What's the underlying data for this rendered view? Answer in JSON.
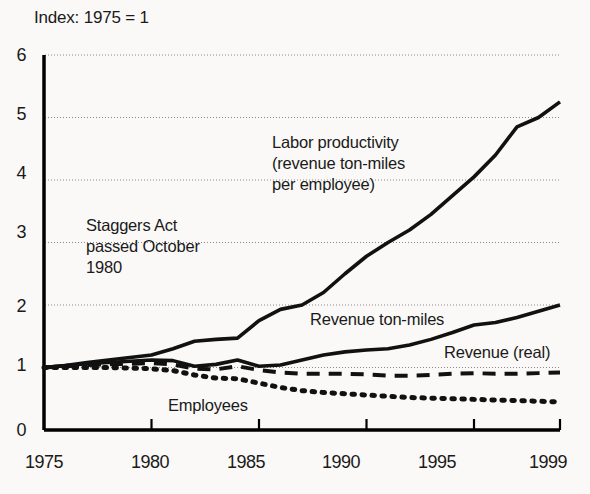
{
  "chart_data": {
    "type": "line",
    "title": "Index: 1975 = 1",
    "xlabel": "",
    "ylabel": "",
    "xlim": [
      1975,
      1999
    ],
    "ylim": [
      0,
      6
    ],
    "xticks": [
      "1975",
      "1980",
      "1985",
      "1990",
      "1995",
      "1999"
    ],
    "xtick_values": [
      1975,
      1980,
      1985,
      1990,
      1995,
      1999
    ],
    "yticks": [
      "0",
      "1",
      "2",
      "3",
      "4",
      "5",
      "6"
    ],
    "ytick_values": [
      0,
      1,
      2,
      3,
      4,
      5,
      6
    ],
    "grid": "horizontal dotted gridlines at each integer y value from 1 to 6",
    "legend": "inline labels placed next to each series",
    "x": [
      1975,
      1976,
      1977,
      1978,
      1979,
      1980,
      1981,
      1982,
      1983,
      1984,
      1985,
      1986,
      1987,
      1988,
      1989,
      1990,
      1991,
      1992,
      1993,
      1994,
      1995,
      1996,
      1997,
      1998,
      1999
    ],
    "series": [
      {
        "name": "Labor productivity (revenue ton-miles per employee)",
        "style": "solid",
        "values": [
          1.0,
          1.03,
          1.08,
          1.12,
          1.16,
          1.2,
          1.3,
          1.42,
          1.45,
          1.47,
          1.75,
          1.93,
          2.0,
          2.2,
          2.5,
          2.78,
          3.0,
          3.2,
          3.45,
          3.75,
          4.05,
          4.4,
          4.85,
          5.0,
          5.25
        ]
      },
      {
        "name": "Revenue ton-miles",
        "style": "solid",
        "values": [
          1.0,
          1.03,
          1.06,
          1.08,
          1.1,
          1.12,
          1.11,
          1.02,
          1.05,
          1.12,
          1.02,
          1.04,
          1.12,
          1.2,
          1.25,
          1.28,
          1.3,
          1.36,
          1.45,
          1.56,
          1.68,
          1.72,
          1.8,
          1.9,
          2.0
        ]
      },
      {
        "name": "Revenue (real)",
        "style": "dashed",
        "values": [
          1.0,
          1.02,
          1.04,
          1.05,
          1.06,
          1.07,
          1.05,
          0.98,
          0.97,
          1.02,
          0.96,
          0.92,
          0.9,
          0.9,
          0.9,
          0.89,
          0.87,
          0.87,
          0.88,
          0.9,
          0.91,
          0.9,
          0.9,
          0.91,
          0.92
        ]
      },
      {
        "name": "Employees",
        "style": "dotted",
        "values": [
          1.0,
          1.0,
          1.0,
          1.0,
          0.99,
          0.98,
          0.95,
          0.88,
          0.83,
          0.82,
          0.75,
          0.68,
          0.63,
          0.6,
          0.58,
          0.56,
          0.54,
          0.52,
          0.51,
          0.5,
          0.49,
          0.48,
          0.47,
          0.46,
          0.45
        ]
      }
    ],
    "annotations": [
      {
        "id": "staggers-act",
        "text": "Staggers Act\npassed October\n1980"
      },
      {
        "id": "labor-productivity",
        "text": "Labor productivity\n(revenue ton-miles\nper employee)"
      },
      {
        "id": "revenue-ton-miles",
        "text": "Revenue ton-miles"
      },
      {
        "id": "revenue-real",
        "text": "Revenue (real)"
      },
      {
        "id": "employees",
        "text": "Employees"
      }
    ],
    "colors": {
      "background": "#faf9f7",
      "line": "#111111",
      "gridline": "#8a8a8a",
      "axis": "#000000",
      "text": "#1a1a1a"
    }
  }
}
